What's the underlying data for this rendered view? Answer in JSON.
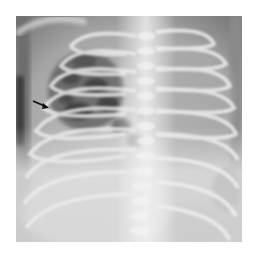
{
  "figure": {
    "type": "radiograph",
    "view": "frontal chest",
    "annotations": [
      {
        "kind": "arrow",
        "color": "#111111",
        "direction": "right-down",
        "position": {
          "x": 27,
          "y": 90
        }
      }
    ],
    "border_color": "#ffffff"
  }
}
